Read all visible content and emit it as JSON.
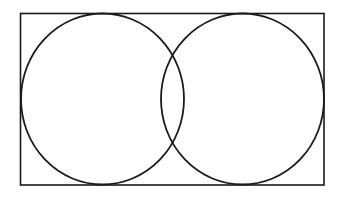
{
  "diagram": {
    "type": "venn",
    "background_color": "#ffffff",
    "stroke_color": "#1a1a1a",
    "canvas": {
      "width": 347,
      "height": 197
    },
    "universe_rect": {
      "x": 20.5,
      "y": 13.5,
      "width": 303.5,
      "height": 171.5,
      "stroke_width": 1.6
    },
    "sets": [
      {
        "id": "left-set",
        "cx": 102.5,
        "cy": 99,
        "rx": 81.5,
        "ry": 85.5,
        "stroke_width": 1.8,
        "label": ""
      },
      {
        "id": "right-set",
        "cx": 242.5,
        "cy": 99,
        "rx": 81.5,
        "ry": 85.5,
        "stroke_width": 1.8,
        "label": ""
      }
    ],
    "labels": []
  }
}
